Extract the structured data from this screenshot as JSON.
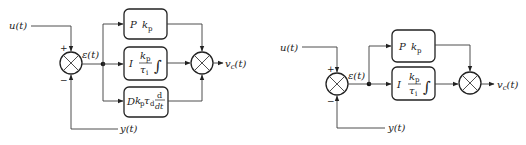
{
  "diagrams": [
    {
      "name": "PID controller",
      "input_label": "u(t)",
      "error_label": "ε(t)",
      "feedback_label": "y(t)",
      "output_label": "v",
      "output_sub": "c",
      "output_suffix": "(t)",
      "plus_sign": "+",
      "minus_sign": "−",
      "blocks": [
        {
          "id": "P",
          "mode": "P",
          "gain": "k",
          "gain_sub": "p"
        },
        {
          "id": "I",
          "mode": "I",
          "num": "k",
          "num_sub": "p",
          "den": "τ",
          "den_sub": "i",
          "op": "∫"
        },
        {
          "id": "D",
          "mode": "D",
          "gain": "k",
          "gain_sub": "p",
          "tau": "τ",
          "tau_sub": "d",
          "op_num": "d",
          "op_den": "dt"
        }
      ]
    },
    {
      "name": "PI controller",
      "input_label": "u(t)",
      "error_label": "ε(t)",
      "feedback_label": "y(t)",
      "output_label": "v",
      "output_sub": "c",
      "output_suffix": "(t)",
      "plus_sign": "+",
      "minus_sign": "−",
      "blocks": [
        {
          "id": "P",
          "mode": "P",
          "gain": "k",
          "gain_sub": "p"
        },
        {
          "id": "I",
          "mode": "I",
          "num": "k",
          "num_sub": "p",
          "den": "τ",
          "den_sub": "i",
          "op": "∫"
        }
      ]
    }
  ],
  "colors": {
    "line": "#3a3a3a",
    "stroke": "#222222",
    "background": "#ffffff"
  }
}
